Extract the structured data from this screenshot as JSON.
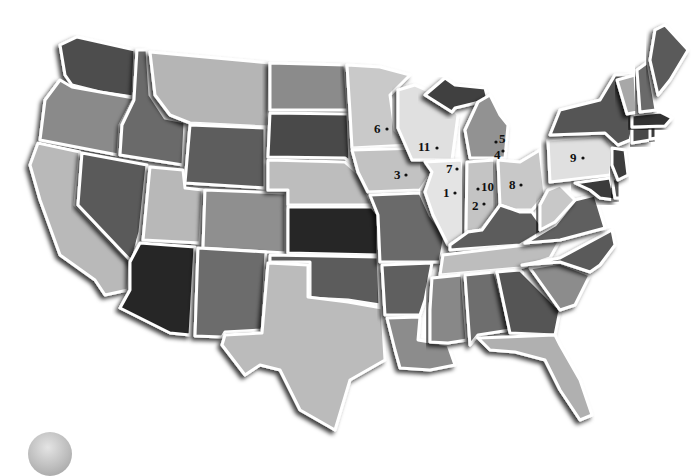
{
  "map": {
    "title": "United States",
    "style": "grayscale beveled state map",
    "colors": {
      "lightest": "#e2e2e2",
      "light": "#c4c4c4",
      "medium": "#8f8f8f",
      "medium_dark": "#6a6a6a",
      "dark": "#4a4a4a",
      "darkest": "#262626",
      "border": "#ffffff"
    },
    "markers": [
      {
        "label": "1",
        "state": "Illinois",
        "x": 452,
        "y": 193
      },
      {
        "label": "2",
        "state": "Indiana",
        "x": 479,
        "y": 206
      },
      {
        "label": "3",
        "state": "Iowa",
        "x": 397,
        "y": 175
      },
      {
        "label": "4",
        "state": "Michigan",
        "x": 497,
        "y": 153
      },
      {
        "label": "5",
        "state": "Michigan",
        "x": 500,
        "y": 140
      },
      {
        "label": "6",
        "state": "Minnesota",
        "x": 377,
        "y": 129
      },
      {
        "label": "7",
        "state": "Illinois",
        "x": 447,
        "y": 169
      },
      {
        "label": "8",
        "state": "Ohio",
        "x": 512,
        "y": 185
      },
      {
        "label": "9",
        "state": "Pennsylvania",
        "x": 572,
        "y": 158
      },
      {
        "label": "10",
        "state": "Indiana",
        "x": 484,
        "y": 187
      },
      {
        "label": "11",
        "state": "Wisconsin",
        "x": 421,
        "y": 147
      }
    ]
  }
}
